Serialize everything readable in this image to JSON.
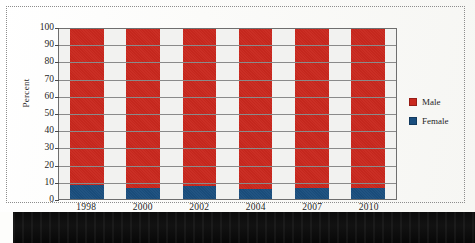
{
  "figure": {
    "background_color": "#fdfdfb",
    "frame_style": "dotted",
    "frame_color": "#8d8d8d",
    "scan_band_color": "#0b0b0b"
  },
  "chart_data": {
    "type": "bar",
    "stacked": true,
    "title": "",
    "subtitle": "",
    "xlabel": "",
    "ylabel": "Percent",
    "categories": [
      "1998",
      "2000",
      "2002",
      "2004",
      "2007",
      "2010"
    ],
    "series": [
      {
        "name": "Female",
        "color": "#1a4e7e",
        "values": [
          8,
          6.5,
          7.5,
          6,
          6.5,
          6.5
        ]
      },
      {
        "name": "Male",
        "color": "#c9281e",
        "values": [
          92,
          93.5,
          92.5,
          94,
          93.5,
          93.5
        ]
      }
    ],
    "ylim": [
      0,
      100
    ],
    "yticks": [
      0,
      10,
      20,
      30,
      40,
      50,
      60,
      70,
      80,
      90,
      100
    ],
    "ytick_labels": [
      "0",
      "10",
      "20",
      "30",
      "40",
      "50",
      "60",
      "70",
      "80",
      "90",
      "100"
    ],
    "grid": true,
    "grid_axis": "y",
    "grid_color": "#8a8a8a",
    "plot_background": "#f2f2f0",
    "legend_position": "right",
    "legend_entries": [
      {
        "label": "Male",
        "color": "#c9281e"
      },
      {
        "label": "Female",
        "color": "#1a4e7e"
      }
    ]
  }
}
